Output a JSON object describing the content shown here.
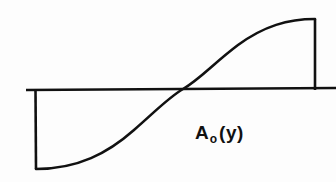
{
  "figure": {
    "kind": "line-diagram",
    "background_color": "#fdfdfd",
    "ink_color": "#111111",
    "width": 336,
    "height": 182,
    "label": {
      "base": "A",
      "subscript": "o",
      "argument": "(y)",
      "full_text": "A₀(y)",
      "x": 195,
      "y": 123
    },
    "geometry": {
      "axis_line": {
        "name": "horizontal-axis",
        "x1": 26,
        "y1": 90,
        "x2": 336,
        "y2": 88
      },
      "left_bound": {
        "name": "left-vertical-bound",
        "x1": 35,
        "y1": 90,
        "x2": 36,
        "y2": 169
      },
      "right_bound": {
        "name": "right-vertical-bound",
        "x1": 315,
        "y1": 19,
        "x2": 315,
        "y2": 90
      },
      "curve": {
        "name": "sigmoid-profile-curve",
        "shape": "s-curve",
        "start": [
          36,
          169
        ],
        "inflection": [
          183,
          89
        ],
        "end": [
          315,
          19
        ],
        "path": "M 36 169 C 78 169 108 153 134 130 C 158 109 168 98 183 89 C 200 79 214 63 238 45 C 264 26 288 19 315 19"
      }
    },
    "curve_data": {
      "type": "line",
      "description": "Odd-symmetric S-shaped amplitude profile A0(y) crossing zero at mid-span",
      "x": [
        36,
        60,
        85,
        110,
        134,
        158,
        183,
        208,
        238,
        264,
        290,
        315
      ],
      "y": [
        169,
        167,
        161,
        150,
        130,
        109,
        89,
        70,
        45,
        30,
        22,
        19
      ],
      "zero_crossing_x": 183,
      "zero_crossing_y": 89,
      "min_y": 169,
      "max_y": 19
    }
  }
}
